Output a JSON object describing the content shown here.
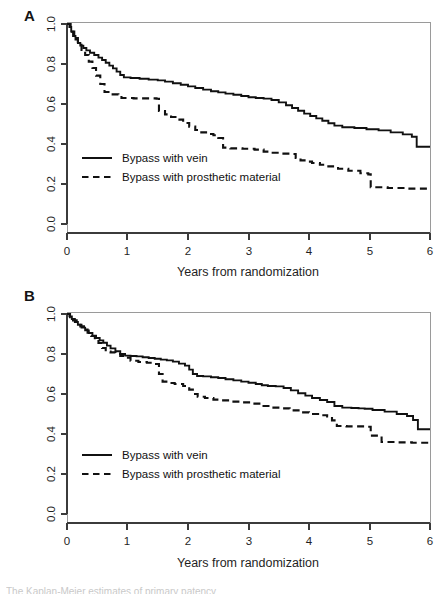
{
  "figure": {
    "title_caption_partial": "The Kaplan-Meier estimates of primary patency",
    "panels": [
      {
        "letter": "A",
        "name": "panel-a"
      },
      {
        "letter": "B",
        "name": "panel-b"
      }
    ],
    "legend": {
      "vein_label": "Bypass with vein",
      "prosthetic_label": "Bypass with prosthetic material"
    },
    "xlabel": "Years from randomization",
    "xticks": [
      "0",
      "1",
      "2",
      "3",
      "4",
      "5",
      "6"
    ],
    "yticks": [
      "0.0",
      "0.2",
      "0.4",
      "0.6",
      "0.8",
      "1.0"
    ],
    "colors": {
      "line": "#111111",
      "axis": "#3b3b3b",
      "box": "#9a9a9a",
      "background": "#ffffff"
    }
  },
  "chart_data": [
    {
      "type": "line",
      "name": "panel-a",
      "title": "A",
      "xlabel": "Years from randomization",
      "ylabel": "",
      "xlim": [
        0,
        6
      ],
      "ylim": [
        0,
        1
      ],
      "xticks": [
        0,
        1,
        2,
        3,
        4,
        5,
        6
      ],
      "yticks": [
        0.0,
        0.2,
        0.4,
        0.6,
        0.8,
        1.0
      ],
      "grid": false,
      "legend_position": "center-left",
      "step": "post",
      "series": [
        {
          "name": "Bypass with vein",
          "style": "solid",
          "x": [
            0.0,
            0.04,
            0.07,
            0.1,
            0.14,
            0.18,
            0.22,
            0.27,
            0.32,
            0.38,
            0.45,
            0.52,
            0.58,
            0.64,
            0.7,
            0.76,
            0.82,
            0.88,
            0.94,
            1.05,
            1.2,
            1.35,
            1.5,
            1.62,
            1.75,
            1.88,
            2.0,
            2.12,
            2.25,
            2.38,
            2.5,
            2.62,
            2.75,
            2.88,
            3.0,
            3.12,
            3.25,
            3.38,
            3.5,
            3.62,
            3.72,
            3.82,
            3.92,
            4.02,
            4.12,
            4.22,
            4.32,
            4.42,
            4.55,
            4.75,
            4.95,
            5.15,
            5.35,
            5.55,
            5.7,
            5.78,
            6.0
          ],
          "y": [
            1.0,
            0.985,
            0.962,
            0.94,
            0.922,
            0.905,
            0.892,
            0.88,
            0.868,
            0.856,
            0.845,
            0.832,
            0.82,
            0.806,
            0.792,
            0.778,
            0.762,
            0.745,
            0.733,
            0.73,
            0.726,
            0.722,
            0.718,
            0.712,
            0.704,
            0.696,
            0.688,
            0.68,
            0.672,
            0.664,
            0.658,
            0.652,
            0.646,
            0.64,
            0.634,
            0.63,
            0.627,
            0.62,
            0.608,
            0.594,
            0.58,
            0.566,
            0.552,
            0.54,
            0.528,
            0.516,
            0.504,
            0.492,
            0.484,
            0.48,
            0.474,
            0.468,
            0.458,
            0.448,
            0.436,
            0.386,
            0.386
          ]
        },
        {
          "name": "Bypass with prosthetic material",
          "style": "dashed",
          "x": [
            0.0,
            0.06,
            0.12,
            0.18,
            0.24,
            0.3,
            0.36,
            0.42,
            0.48,
            0.55,
            0.62,
            0.72,
            0.85,
            0.9,
            1.1,
            1.3,
            1.48,
            1.52,
            1.62,
            1.72,
            1.82,
            1.92,
            2.02,
            2.12,
            2.22,
            2.32,
            2.42,
            2.5,
            2.58,
            2.7,
            2.9,
            3.1,
            3.25,
            3.4,
            3.55,
            3.7,
            3.78,
            3.86,
            3.95,
            4.05,
            4.18,
            4.32,
            4.48,
            4.65,
            4.85,
            4.98,
            5.02,
            5.3,
            5.6,
            6.0
          ],
          "y": [
            1.0,
            0.962,
            0.93,
            0.896,
            0.87,
            0.845,
            0.812,
            0.78,
            0.742,
            0.7,
            0.66,
            0.648,
            0.64,
            0.63,
            0.628,
            0.628,
            0.626,
            0.565,
            0.548,
            0.535,
            0.522,
            0.505,
            0.487,
            0.47,
            0.458,
            0.45,
            0.444,
            0.43,
            0.382,
            0.378,
            0.376,
            0.372,
            0.362,
            0.356,
            0.352,
            0.35,
            0.33,
            0.318,
            0.312,
            0.305,
            0.296,
            0.288,
            0.276,
            0.266,
            0.254,
            0.248,
            0.184,
            0.18,
            0.177,
            0.176
          ]
        }
      ]
    },
    {
      "type": "line",
      "name": "panel-b",
      "title": "B",
      "xlabel": "Years from randomization",
      "ylabel": "",
      "xlim": [
        0,
        6
      ],
      "ylim": [
        0,
        1
      ],
      "xticks": [
        0,
        1,
        2,
        3,
        4,
        5,
        6
      ],
      "yticks": [
        0.0,
        0.2,
        0.4,
        0.6,
        0.8,
        1.0
      ],
      "grid": false,
      "legend_position": "center-left",
      "step": "post",
      "series": [
        {
          "name": "Bypass with vein",
          "style": "solid",
          "x": [
            0.0,
            0.04,
            0.08,
            0.13,
            0.18,
            0.24,
            0.3,
            0.36,
            0.42,
            0.48,
            0.54,
            0.6,
            0.66,
            0.72,
            0.8,
            0.88,
            0.96,
            1.05,
            1.15,
            1.25,
            1.35,
            1.45,
            1.55,
            1.65,
            1.75,
            1.85,
            1.95,
            2.02,
            2.08,
            2.15,
            2.25,
            2.38,
            2.5,
            2.62,
            2.75,
            2.88,
            3.0,
            3.12,
            3.22,
            3.32,
            3.45,
            3.58,
            3.7,
            3.82,
            3.94,
            4.05,
            4.18,
            4.3,
            4.42,
            4.55,
            4.7,
            4.82,
            4.92,
            5.05,
            5.25,
            5.45,
            5.62,
            5.72,
            5.8,
            6.0
          ],
          "y": [
            1.0,
            0.988,
            0.975,
            0.96,
            0.946,
            0.932,
            0.918,
            0.905,
            0.892,
            0.88,
            0.868,
            0.856,
            0.842,
            0.828,
            0.814,
            0.8,
            0.792,
            0.79,
            0.788,
            0.784,
            0.78,
            0.776,
            0.772,
            0.768,
            0.762,
            0.752,
            0.742,
            0.722,
            0.7,
            0.69,
            0.688,
            0.684,
            0.68,
            0.674,
            0.668,
            0.662,
            0.656,
            0.65,
            0.644,
            0.64,
            0.638,
            0.63,
            0.618,
            0.604,
            0.592,
            0.58,
            0.57,
            0.56,
            0.54,
            0.532,
            0.53,
            0.528,
            0.526,
            0.52,
            0.512,
            0.5,
            0.49,
            0.47,
            0.424,
            0.424
          ]
        },
        {
          "name": "Bypass with prosthetic material",
          "style": "dashed",
          "x": [
            0.0,
            0.05,
            0.1,
            0.16,
            0.22,
            0.28,
            0.34,
            0.4,
            0.46,
            0.52,
            0.58,
            0.64,
            0.72,
            0.8,
            0.88,
            0.96,
            1.05,
            1.18,
            1.32,
            1.45,
            1.52,
            1.58,
            1.66,
            1.78,
            1.92,
            2.02,
            2.08,
            2.16,
            2.28,
            2.42,
            2.56,
            2.7,
            2.88,
            3.05,
            3.22,
            3.38,
            3.52,
            3.68,
            3.85,
            4.0,
            4.15,
            4.3,
            4.38,
            4.46,
            4.62,
            4.8,
            4.95,
            5.02,
            5.2,
            5.45,
            5.7,
            6.0
          ],
          "y": [
            1.0,
            0.984,
            0.968,
            0.952,
            0.938,
            0.922,
            0.906,
            0.89,
            0.874,
            0.855,
            0.83,
            0.812,
            0.808,
            0.8,
            0.79,
            0.782,
            0.766,
            0.76,
            0.756,
            0.75,
            0.7,
            0.662,
            0.655,
            0.65,
            0.64,
            0.622,
            0.6,
            0.586,
            0.58,
            0.572,
            0.568,
            0.562,
            0.558,
            0.552,
            0.54,
            0.532,
            0.528,
            0.518,
            0.508,
            0.5,
            0.494,
            0.488,
            0.468,
            0.44,
            0.438,
            0.438,
            0.436,
            0.392,
            0.36,
            0.358,
            0.356,
            0.356
          ]
        }
      ]
    }
  ]
}
